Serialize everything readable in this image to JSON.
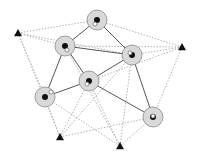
{
  "diagram": {
    "width": 197,
    "height": 155,
    "colors": {
      "background": "#ffffff",
      "node_fill": "#d9d9d9",
      "node_stroke": "#8a8a8a",
      "node_center": "#111111",
      "node_marker": "#ffffff",
      "solid_edge": "#555555",
      "dotted_edge": "#b5b5b5",
      "anchor": "#111111"
    },
    "nodes": [
      {
        "id": "A",
        "x": 97,
        "y": 20,
        "r": 10,
        "marker": [
          -2,
          4
        ]
      },
      {
        "id": "B",
        "x": 65,
        "y": 46,
        "r": 10,
        "marker": [
          2,
          4
        ]
      },
      {
        "id": "C",
        "x": 132,
        "y": 55,
        "r": 10,
        "marker": [
          -2,
          -2
        ]
      },
      {
        "id": "D",
        "x": 89,
        "y": 81,
        "r": 10,
        "marker": [
          -2,
          3
        ]
      },
      {
        "id": "E",
        "x": 45,
        "y": 97,
        "r": 10,
        "marker": [
          6,
          -5
        ]
      },
      {
        "id": "F",
        "x": 153,
        "y": 117,
        "r": 10,
        "marker": [
          0,
          -1
        ]
      }
    ],
    "anchors": [
      {
        "id": "T1",
        "x": 18,
        "y": 33
      },
      {
        "id": "T2",
        "x": 182,
        "y": 47
      },
      {
        "id": "T3",
        "x": 60,
        "y": 137
      },
      {
        "id": "T4",
        "x": 120,
        "y": 146
      }
    ],
    "solid_edges": [
      [
        "A",
        "B"
      ],
      [
        "A",
        "C"
      ],
      [
        "B",
        "C"
      ],
      [
        "B",
        "D"
      ],
      [
        "B",
        "E"
      ],
      [
        "C",
        "D"
      ],
      [
        "D",
        "E"
      ],
      [
        "D",
        "F"
      ],
      [
        "C",
        "F"
      ]
    ],
    "dotted_edges": [
      [
        "T1",
        "A"
      ],
      [
        "T1",
        "B"
      ],
      [
        "T1",
        "C"
      ],
      [
        "T1",
        "E"
      ],
      [
        "T1",
        "T3"
      ],
      [
        "T2",
        "A"
      ],
      [
        "T2",
        "B"
      ],
      [
        "T2",
        "C"
      ],
      [
        "T2",
        "F"
      ],
      [
        "T2",
        "D"
      ],
      [
        "T3",
        "E"
      ],
      [
        "T3",
        "D"
      ],
      [
        "T3",
        "F"
      ],
      [
        "T3",
        "C"
      ],
      [
        "T4",
        "E"
      ],
      [
        "T4",
        "D"
      ],
      [
        "T4",
        "F"
      ],
      [
        "T4",
        "C"
      ],
      [
        "T4",
        "B"
      ]
    ]
  }
}
